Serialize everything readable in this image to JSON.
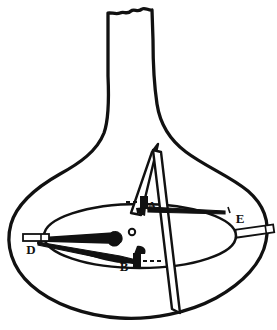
{
  "figure": {
    "style": "antique line engraving, black ink on white",
    "canvas": {
      "width": 277,
      "height": 330,
      "background": "#ffffff"
    },
    "ink_color": "#111111",
    "vessel": {
      "name": "flask-outline",
      "description": "bulbous gourd-shaped body with a narrow vertical neck broken off at the top",
      "neck_top_edge": "jagged / broken",
      "outline_stroke_width": 3.2
    },
    "inner_ellipse": {
      "name": "inner-ring",
      "description": "oval ring drawn inside the body representing the inner rim of the vessel",
      "stroke_width": 2.4
    },
    "blade": {
      "name": "pivot-blade",
      "description": "long narrow pointed blade running from upper centre down through the body and past the base"
    },
    "pivot": {
      "name": "pivot-dot",
      "description": "small open circle marking the central pivot point"
    },
    "labels": [
      {
        "id": "A",
        "text": "A",
        "x": 152,
        "y": 202,
        "marker": "filled-block",
        "leader": "dashed"
      },
      {
        "id": "B",
        "text": "B",
        "x": 124,
        "y": 266,
        "marker": "filled-block",
        "leader": "dashed"
      },
      {
        "id": "D",
        "text": "D",
        "x": 31,
        "y": 251,
        "marker": "slotted-bar",
        "leader": "none"
      },
      {
        "id": "E",
        "text": "E",
        "x": 238,
        "y": 220,
        "marker": "slotted-bar",
        "leader": "tick"
      }
    ],
    "markers": {
      "A_block": "solid black rectangle at the upper catch point",
      "B_block": "solid black rectangle at the lower catch point",
      "D_bar": "small horizontal slotted bar at the left wall",
      "E_bar": "small tilted slotted bar at the right wall"
    }
  }
}
